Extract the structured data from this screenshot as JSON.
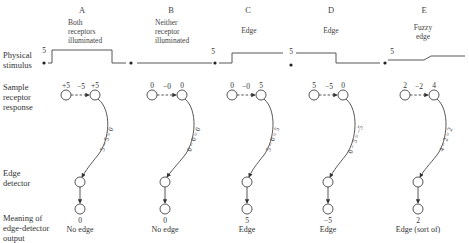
{
  "row_labels": {
    "stimulus": [
      "Physical",
      "stimulus"
    ],
    "response": [
      "Sample",
      "receptor",
      "response"
    ],
    "detector": [
      "Edge",
      "detector"
    ],
    "meaning": [
      "Meaning of",
      "edge-detector",
      "output"
    ]
  },
  "columns": [
    {
      "letter": "A",
      "description": [
        "Both",
        "receptors",
        "illuminated"
      ],
      "stimulus_level_label": "5",
      "receptor_left": "+5",
      "inhibition": "−5",
      "receptor_right": "+5",
      "equation": "5 − 5 = 0",
      "output_value": "0",
      "meaning": "No edge"
    },
    {
      "letter": "B",
      "description": [
        "Neither",
        "receptor",
        "illuminated"
      ],
      "stimulus_level_label": "5",
      "receptor_left": "0",
      "inhibition": "−0",
      "receptor_right": "0",
      "equation": "0 − 0 = 0",
      "output_value": "0",
      "meaning": "No edge"
    },
    {
      "letter": "C",
      "description": [
        "Edge"
      ],
      "stimulus_level_label": "5",
      "receptor_left": "0",
      "inhibition": "−0",
      "receptor_right": "5",
      "equation": "5 − 0 = 5",
      "output_value": "5",
      "meaning": "Edge"
    },
    {
      "letter": "D",
      "description": [
        "Edge"
      ],
      "stimulus_level_label": "5",
      "receptor_left": "5",
      "inhibition": "−5",
      "receptor_right": "0",
      "equation": "0 − 5 = −5",
      "output_value": "−5",
      "meaning": "Edge"
    },
    {
      "letter": "E",
      "description": [
        "Fuzzy",
        "edge"
      ],
      "stimulus_level_label": "5",
      "receptor_left": "2",
      "inhibition": "−2",
      "receptor_right": "4",
      "equation": "4 − 2 = 2",
      "output_value": "2",
      "meaning": "Edge (sort of)"
    }
  ]
}
